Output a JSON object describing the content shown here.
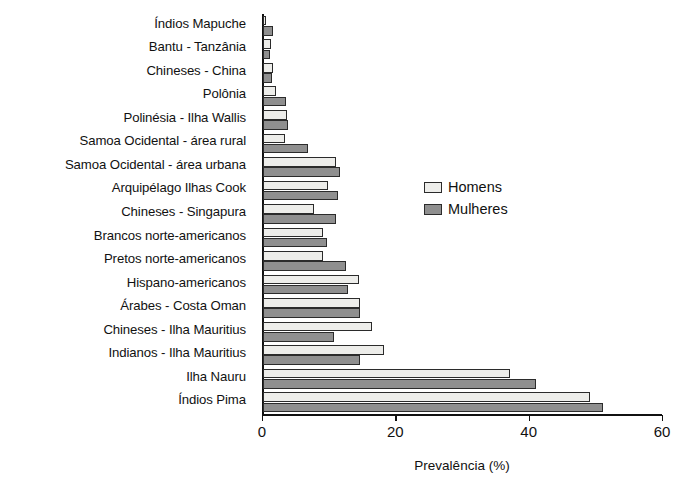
{
  "chart_data": {
    "type": "bar",
    "orientation": "horizontal",
    "title": "",
    "xlabel": "Prevalência (%)",
    "ylabel": "",
    "xlim": [
      0,
      60
    ],
    "xticks": [
      0,
      20,
      40,
      60
    ],
    "xtick_labels": [
      "0",
      "20",
      "40",
      "60"
    ],
    "grid": false,
    "legend_position": "center-right",
    "categories": [
      "Índios Mapuche",
      "Bantu - Tanzânia",
      "Chineses - China",
      "Polônia",
      "Polinésia - Ilha Wallis",
      "Samoa Ocidental - área rural",
      "Samoa Ocidental - área urbana",
      "Arquipélago Ilhas Cook",
      "Chineses - Singapura",
      "Brancos norte-americanos",
      "Pretos norte-americanos",
      "Hispano-americanos",
      "Árabes - Costa Oman",
      "Chineses - Ilha Mauritius",
      "Indianos - Ilha Mauritius",
      "Ilha Nauru",
      "Índios Pima"
    ],
    "series": [
      {
        "name": "Homens",
        "color": "#ededea",
        "values": [
          0.4,
          1.2,
          1.5,
          2.0,
          3.6,
          3.3,
          11.0,
          9.8,
          7.7,
          9.0,
          9.0,
          14.4,
          14.6,
          16.3,
          18.2,
          37.0,
          49.0
        ]
      },
      {
        "name": "Mulheres",
        "color": "#8f8f8f",
        "values": [
          1.5,
          1.1,
          1.4,
          3.5,
          3.8,
          6.8,
          11.5,
          11.3,
          11.0,
          9.6,
          12.5,
          12.8,
          14.6,
          10.6,
          14.5,
          41.0,
          51.0
        ]
      }
    ],
    "legend": [
      "Homens",
      "Mulheres"
    ]
  },
  "legend": {
    "homens_label": "Homens",
    "mulheres_label": "Mulheres"
  },
  "axis": {
    "x_title": "Prevalência (%)",
    "tick_0": "0",
    "tick_20": "20",
    "tick_40": "40",
    "tick_60": "60"
  }
}
